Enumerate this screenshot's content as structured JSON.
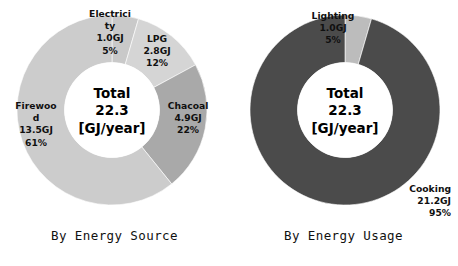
{
  "figure": {
    "background": "#ffffff",
    "text_color": "#101010"
  },
  "charts": [
    {
      "id": "by-energy-source",
      "caption": "By Energy Source",
      "center": {
        "line1": "Total",
        "line2": "22.3",
        "line3": "[GJ/year]"
      },
      "slices": [
        {
          "name": "Electricity",
          "label_l1": "Electrici",
          "label_l2": "ty",
          "value_label": "1.0GJ",
          "percent_label": "5%",
          "value": 1.0,
          "percent": 5,
          "color": "#c9c9c9"
        },
        {
          "name": "LPG",
          "label_l1": "LPG",
          "label_l2": "",
          "value_label": "2.8GJ",
          "percent_label": "12%",
          "value": 2.8,
          "percent": 12,
          "color": "#d5d5d5"
        },
        {
          "name": "Chacoal",
          "label_l1": "Chacoal",
          "label_l2": "",
          "value_label": "4.9GJ",
          "percent_label": "22%",
          "value": 4.9,
          "percent": 22,
          "color": "#a9a9a9"
        },
        {
          "name": "Firewood",
          "label_l1": "Firewoo",
          "label_l2": "d",
          "value_label": "13.5GJ",
          "percent_label": "61%",
          "value": 13.5,
          "percent": 61,
          "color": "#cccccc"
        }
      ]
    },
    {
      "id": "by-energy-usage",
      "caption": "By Energy Usage",
      "center": {
        "line1": "Total",
        "line2": "22.3",
        "line3": "[GJ/year]"
      },
      "slices": [
        {
          "name": "Lighting",
          "label_l1": "Lighting",
          "label_l2": "",
          "value_label": "1.0GJ",
          "percent_label": "5%",
          "value": 1.0,
          "percent": 5,
          "color": "#bcbcbc"
        },
        {
          "name": "Cooking",
          "label_l1": "Cooking",
          "label_l2": "",
          "value_label": "21.2GJ",
          "percent_label": "95%",
          "value": 21.2,
          "percent": 95,
          "color": "#4b4b4b"
        }
      ]
    }
  ],
  "chart_data": [
    {
      "type": "pie",
      "title": "By Energy Source",
      "subtitle": "Total 22.3 [GJ/year]",
      "unit": "GJ/year",
      "total": 22.3,
      "center_text": [
        "Total",
        "22.3",
        "[GJ/year]"
      ],
      "categories": [
        "Electricity",
        "LPG",
        "Chacoal",
        "Firewood"
      ],
      "values": [
        1.0,
        2.8,
        4.9,
        13.5
      ],
      "percentages": [
        5,
        12,
        22,
        61
      ],
      "colors": [
        "#c9c9c9",
        "#d5d5d5",
        "#a9a9a9",
        "#cccccc"
      ],
      "donut": true,
      "inner_radius_ratio": 0.5,
      "start_angle_deg": 0,
      "direction": "clockwise",
      "legend": "none",
      "grid": false,
      "labels_on_slices": true
    },
    {
      "type": "pie",
      "title": "By Energy Usage",
      "subtitle": "Total 22.3 [GJ/year]",
      "unit": "GJ/year",
      "total": 22.3,
      "center_text": [
        "Total",
        "22.3",
        "[GJ/year]"
      ],
      "categories": [
        "Lighting",
        "Cooking"
      ],
      "values": [
        1.0,
        21.2
      ],
      "percentages": [
        5,
        95
      ],
      "colors": [
        "#bcbcbc",
        "#4b4b4b"
      ],
      "donut": true,
      "inner_radius_ratio": 0.5,
      "start_angle_deg": 0,
      "direction": "clockwise",
      "legend": "none",
      "grid": false,
      "labels_on_slices": true
    }
  ]
}
